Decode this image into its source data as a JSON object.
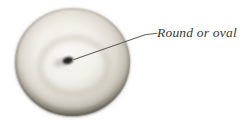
{
  "figure": {
    "label": "Round or oval",
    "colors": {
      "background": "#ffffff",
      "label_text": "#3b3935",
      "leader_line": "#55524c",
      "lesion_center": "#f8f7f3",
      "lesion_rim_dark": "#4f4c45",
      "punctum": "#242220"
    }
  }
}
